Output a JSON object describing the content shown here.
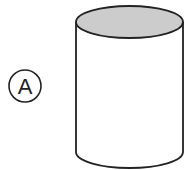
{
  "figure": {
    "label": "A",
    "shape": "cylinder",
    "colors": {
      "stroke": "#222222",
      "top_fill": "#cccccc",
      "body_fill": "#ffffff"
    }
  }
}
